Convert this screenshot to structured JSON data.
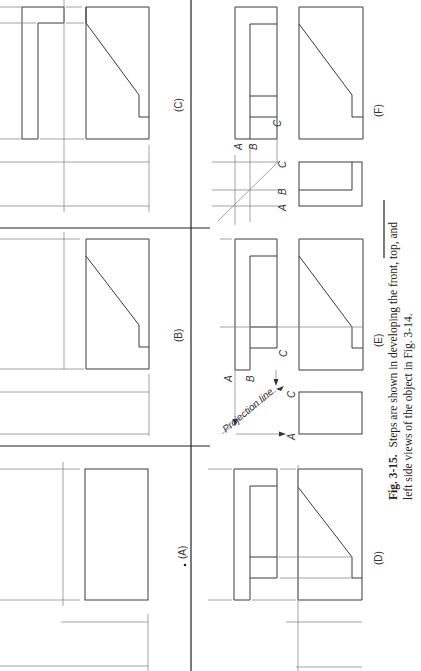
{
  "figure": {
    "number": "Fig. 3-15.",
    "caption_line1": "Steps are shown in developing the front, top, and",
    "caption_line2": "left side views of the object in Fig. 3-14.",
    "orientation": "rotated 90° counter-clockwise"
  },
  "panels": [
    {
      "id": "A",
      "label": "(A)"
    },
    {
      "id": "B",
      "label": "(B)"
    },
    {
      "id": "C",
      "label": "(C)"
    },
    {
      "id": "D",
      "label": "(D)"
    },
    {
      "id": "E",
      "label": "(E)"
    },
    {
      "id": "F",
      "label": "(F)"
    }
  ],
  "annotations": {
    "projection_line": "Projection line",
    "point_a": "A",
    "point_b": "B",
    "point_c": "C"
  }
}
